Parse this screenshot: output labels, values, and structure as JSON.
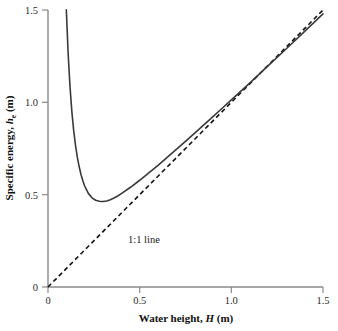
{
  "chart_data": {
    "type": "line",
    "title": "",
    "xlabel": "Water height, H (m)",
    "ylabel": "Specific energy, he (m)",
    "xlabel_parts": {
      "prefix": "Water height, ",
      "variable": "H",
      "suffix": " (m)"
    },
    "ylabel_parts": {
      "prefix": "Specific energy, ",
      "variable": "h",
      "subscript": "e",
      "suffix": " (m)"
    },
    "xlim": [
      0,
      1.5
    ],
    "ylim": [
      0,
      1.5
    ],
    "xticks": [
      "0",
      "0.5",
      "1.0",
      "1.5"
    ],
    "xtick_values": [
      0,
      0.5,
      1.0,
      1.5
    ],
    "yticks": [
      "0",
      "0.5",
      "1.0",
      "1.5"
    ],
    "ytick_values": [
      0,
      0.5,
      1.0,
      1.5
    ],
    "grid": false,
    "legend": "none",
    "annotations": [
      {
        "text": "1:1 line",
        "x": 0.44,
        "y": 0.3
      }
    ],
    "series": [
      {
        "name": "Specific energy curve",
        "style": "solid",
        "color": "#3a3a3a",
        "minimum": {
          "x": 0.29,
          "y": 0.44
        },
        "x": [
          0.1,
          0.11,
          0.12,
          0.13,
          0.14,
          0.15,
          0.16,
          0.17,
          0.18,
          0.19,
          0.2,
          0.22,
          0.24,
          0.26,
          0.28,
          0.29,
          0.3,
          0.32,
          0.34,
          0.36,
          0.38,
          0.4,
          0.45,
          0.5,
          0.55,
          0.6,
          0.65,
          0.7,
          0.75,
          0.8,
          0.85,
          0.9,
          0.95,
          1.0,
          1.1,
          1.2,
          1.3,
          1.4,
          1.5
        ],
        "y": [
          1.501,
          1.262,
          1.085,
          0.951,
          0.848,
          0.767,
          0.703,
          0.651,
          0.609,
          0.575,
          0.547,
          0.507,
          0.483,
          0.47,
          0.464,
          0.463,
          0.463,
          0.466,
          0.473,
          0.482,
          0.493,
          0.506,
          0.54,
          0.578,
          0.618,
          0.659,
          0.702,
          0.745,
          0.789,
          0.833,
          0.878,
          0.923,
          0.968,
          1.013,
          1.104,
          1.197,
          1.29,
          1.384,
          1.479
        ]
      },
      {
        "name": "1:1 line",
        "style": "dashed",
        "color": "#111111",
        "x": [
          0,
          1.5
        ],
        "y": [
          0,
          1.5
        ]
      }
    ]
  },
  "axes": {
    "axis_color": "#8a8a8a",
    "tick_color": "#8a8a8a"
  }
}
